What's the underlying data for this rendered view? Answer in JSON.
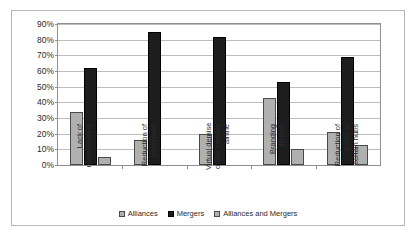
{
  "chart_data": {
    "type": "bar",
    "title": "",
    "subtitle": "",
    "xlabel": "",
    "ylabel": "",
    "ylim": [
      0,
      90
    ],
    "ytick_labels": [
      "90%",
      "80%",
      "70%",
      "60%",
      "50%",
      "40%",
      "30%",
      "20%",
      "10%",
      "0%"
    ],
    "ytick_values": [
      90,
      80,
      70,
      60,
      50,
      40,
      30,
      20,
      10,
      0
    ],
    "grid": true,
    "legend_position": "bottom",
    "categories": [
      "Lack of manoeuvring",
      "Reduction of personnel",
      "Virtual demise of the smaller airline",
      "Branding dilution",
      "Reduction of traffic in certain hubs"
    ],
    "category_lines": [
      [
        "Lack of",
        "manoeuvring"
      ],
      [
        "Reduction of",
        "personnel"
      ],
      [
        "Virtual demise",
        "of the smaller",
        "airline"
      ],
      [
        "Branding",
        "dilution"
      ],
      [
        "Reduction of",
        "traffic in",
        "certain hubs"
      ]
    ],
    "series": [
      {
        "name": "Alliances",
        "color": "#b0b0b0",
        "values": [
          34,
          16,
          20,
          43,
          21
        ]
      },
      {
        "name": "Mergers",
        "color": "#1d1d1d",
        "values": [
          62,
          85,
          82,
          53,
          69
        ]
      },
      {
        "name": "Alliances and Mergers",
        "color": "#b0b0b0",
        "values": [
          5,
          0,
          0,
          10,
          13
        ]
      }
    ]
  }
}
